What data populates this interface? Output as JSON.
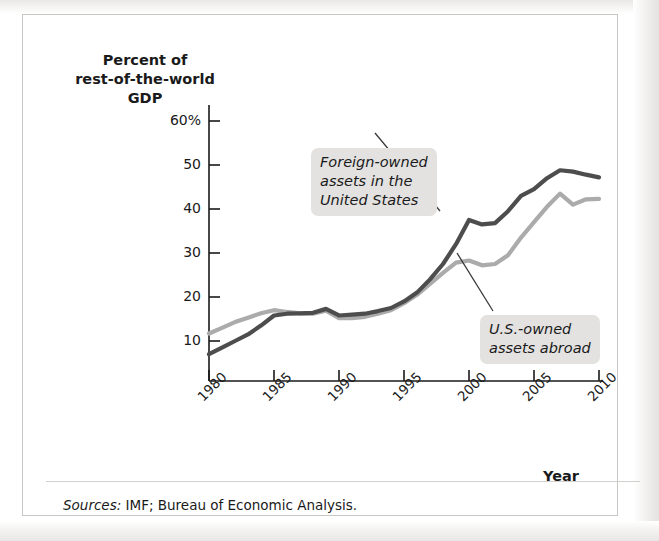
{
  "figure": {
    "y_axis_title": "Percent of\nrest-of-the-world\nGDP",
    "x_axis_title": "Year",
    "source_label": "Sources:",
    "source_text": " IMF; Bureau of Economic Analysis.",
    "annotations": [
      {
        "id": "foreign-owned",
        "text": "Foreign-owned\nassets in the\nUnited States"
      },
      {
        "id": "us-owned",
        "text": "U.S.-owned\nassets abroad"
      }
    ]
  },
  "chart_data": {
    "type": "line",
    "title": "",
    "xlabel": "Year",
    "ylabel": "Percent of rest-of-the-world GDP",
    "xlim": [
      1980,
      2010
    ],
    "ylim": [
      0,
      62
    ],
    "xticks": [
      1980,
      1985,
      1990,
      1995,
      2000,
      2005,
      2010
    ],
    "xtick_labels": [
      "1980",
      "1985",
      "1990",
      "1995",
      "2000",
      "2005",
      "2010"
    ],
    "yticks": [
      10,
      20,
      30,
      40,
      50,
      60
    ],
    "ytick_labels": [
      "10",
      "20",
      "30",
      "40",
      "50",
      "60%"
    ],
    "grid": false,
    "legend": "annotated-callouts",
    "colors": {
      "foreign_owned": "#4d4d4d",
      "us_owned": "#ababab",
      "axis": "#1a1a1a",
      "callout_background": "#e3e2e0",
      "leader_line": "#3a3a3a"
    },
    "x": [
      1980,
      1981,
      1982,
      1983,
      1984,
      1985,
      1986,
      1987,
      1988,
      1989,
      1990,
      1991,
      1992,
      1993,
      1994,
      1995,
      1996,
      1997,
      1998,
      1999,
      2000,
      2001,
      2002,
      2003,
      2004,
      2005,
      2006,
      2007,
      2008,
      2009,
      2010
    ],
    "series": [
      {
        "name": "Foreign-owned assets in the United States",
        "color": "#4d4d4d",
        "values": [
          7,
          8.5,
          10,
          11.5,
          13.5,
          15.8,
          16.2,
          16.3,
          16.4,
          17.3,
          15.8,
          16,
          16.2,
          16.8,
          17.5,
          19,
          21,
          24,
          27.5,
          32,
          37.5,
          36.5,
          36.8,
          39.5,
          43,
          44.5,
          47,
          48.8,
          48.5,
          47.8,
          47.2
        ]
      },
      {
        "name": "U.S.-owned assets abroad",
        "color": "#ababab",
        "values": [
          11.7,
          13,
          14.3,
          15.3,
          16.3,
          17,
          16.6,
          16.3,
          16.2,
          16.9,
          15.2,
          15.2,
          15.5,
          16.2,
          17,
          18.6,
          20.5,
          23,
          25.5,
          27.8,
          28.3,
          27.2,
          27.5,
          29.5,
          33.5,
          37,
          40.5,
          43.5,
          41,
          42.2,
          42.3
        ]
      }
    ]
  }
}
